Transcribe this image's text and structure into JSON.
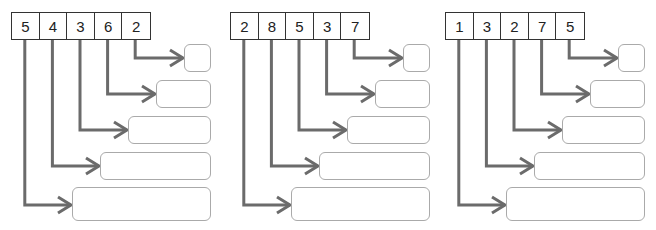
{
  "diagram": {
    "line_color": "#6b6b6b",
    "box_border_color": "#aaaaaa",
    "groups": [
      {
        "digits": [
          "5",
          "4",
          "3",
          "6",
          "2"
        ],
        "answer_boxes": [
          "",
          "",
          "",
          "",
          ""
        ]
      },
      {
        "digits": [
          "2",
          "8",
          "5",
          "3",
          "7"
        ],
        "answer_boxes": [
          "",
          "",
          "",
          "",
          ""
        ]
      },
      {
        "digits": [
          "1",
          "3",
          "2",
          "7",
          "5"
        ],
        "answer_boxes": [
          "",
          "",
          "",
          "",
          ""
        ]
      }
    ]
  }
}
